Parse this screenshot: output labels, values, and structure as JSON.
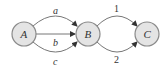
{
  "diagram": {
    "nodes": [
      {
        "id": "A",
        "label": "A",
        "cx": 24,
        "cy": 34
      },
      {
        "id": "B",
        "label": "B",
        "cx": 88,
        "cy": 34
      },
      {
        "id": "C",
        "label": "C",
        "cx": 147,
        "cy": 34
      }
    ],
    "edges": [
      {
        "from": "A",
        "to": "B",
        "label": "a",
        "shape": "arc-up"
      },
      {
        "from": "A",
        "to": "B",
        "label": "b",
        "shape": "straight"
      },
      {
        "from": "A",
        "to": "B",
        "label": "c",
        "shape": "arc-down"
      },
      {
        "from": "B",
        "to": "C",
        "label": "1",
        "shape": "arc-up"
      },
      {
        "from": "B",
        "to": "C",
        "label": "2",
        "shape": "arc-down"
      }
    ],
    "colors": {
      "node_fill": "#e4e4e4",
      "node_stroke": "#8a8a8a",
      "edge": "#777777"
    }
  }
}
